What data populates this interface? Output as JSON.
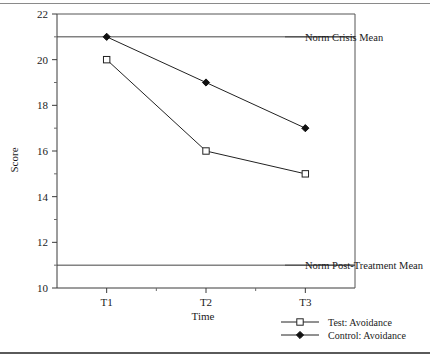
{
  "figure": {
    "has_top_rule": true,
    "has_bottom_rule": true
  },
  "chart_data": {
    "type": "line",
    "title": "",
    "xlabel": "Time",
    "ylabel": "Score",
    "categories": [
      "T1",
      "T2",
      "T3"
    ],
    "x": [
      1,
      2,
      3
    ],
    "ylim": [
      10,
      22
    ],
    "xlim": [
      0.5,
      3.5
    ],
    "y_ticks": [
      10,
      12,
      14,
      16,
      18,
      20,
      22
    ],
    "y_minor_ticks": [
      11,
      13,
      15,
      17,
      19,
      21
    ],
    "grid": false,
    "legend_position": "bottom-right",
    "series": [
      {
        "name": "Test: Avoidance",
        "marker": "open-square",
        "values": [
          20,
          16,
          15
        ]
      },
      {
        "name": "Control: Avoidance",
        "marker": "filled-diamond",
        "values": [
          21,
          19,
          17
        ]
      }
    ],
    "reference_lines": [
      {
        "label": "Norm Crisis Mean",
        "value": 21
      },
      {
        "label": "Norm Post-Treatment Mean",
        "value": 11
      }
    ]
  }
}
